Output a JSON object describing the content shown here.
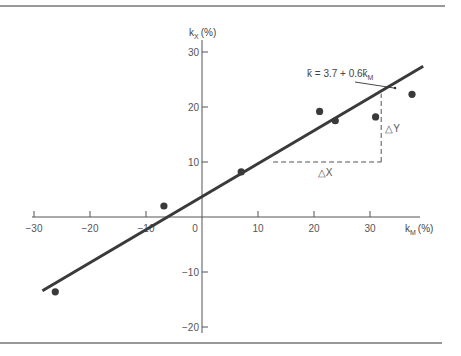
{
  "chart_data": {
    "type": "scatter",
    "title": "",
    "xlabel": "k̄M (%)",
    "ylabel": "k̄X (%)",
    "xlabel_main": "k",
    "xlabel_sub": "M",
    "xlabel_unit": "(%)",
    "ylabel_main": "k",
    "ylabel_sub": "X",
    "ylabel_unit": "(%)",
    "xlim": [
      -30,
      38
    ],
    "ylim": [
      -21,
      32
    ],
    "x_ticks": [
      -30,
      -20,
      -10,
      0,
      10,
      20,
      30
    ],
    "x_tick_labels": [
      "−30",
      "−20",
      "−10",
      "0",
      "10",
      "20",
      "30"
    ],
    "y_ticks": [
      -20,
      -10,
      10,
      20,
      30
    ],
    "y_tick_labels": [
      "−20",
      "−10",
      "10",
      "20",
      "30"
    ],
    "grid": false,
    "points": [
      {
        "x": -26.2,
        "y": -13.6
      },
      {
        "x": -6.8,
        "y": 2.0
      },
      {
        "x": 7.0,
        "y": 8.2
      },
      {
        "x": 21.0,
        "y": 19.2
      },
      {
        "x": 23.8,
        "y": 17.5
      },
      {
        "x": 31.0,
        "y": 18.2
      },
      {
        "x": 37.5,
        "y": 22.3
      }
    ],
    "regression": {
      "intercept": 3.7,
      "slope": 0.6,
      "x_range": [
        -28.5,
        39.5
      ],
      "equation_main": "k̄ = 3.7 + 0.6k̄",
      "equation_sub": "M"
    },
    "slope_triangle": {
      "x_start": 12.7,
      "x_end": 32.0,
      "y_base": 10,
      "y_top": 22.4,
      "dx_label": "△X",
      "dy_label": "△Y"
    },
    "colors": {
      "line": "#3a3a3a",
      "points": "#3a3a3a",
      "axes": "#555555",
      "rules": "#333333"
    }
  }
}
